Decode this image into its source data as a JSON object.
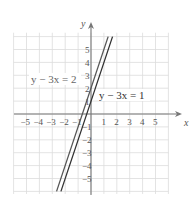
{
  "chart_data": {
    "type": "line",
    "title": "",
    "xlabel": "x",
    "ylabel": "y",
    "xlim": [
      -6,
      6
    ],
    "ylim": [
      -6,
      6
    ],
    "grid": true,
    "x_ticks": [
      "-5",
      "-4",
      "-3",
      "-2",
      "-1",
      "1",
      "2",
      "3",
      "4",
      "5"
    ],
    "y_ticks": [
      "5",
      "4",
      "3",
      "2",
      "1",
      "-1",
      "-2",
      "-3",
      "-4",
      "-5"
    ],
    "series": [
      {
        "name": "y - 3x = 2",
        "equation": "y = 3x + 2",
        "slope": 3,
        "intercept": 2,
        "color": "#555555",
        "x": [
          -2.67,
          1.33
        ],
        "y": [
          -6,
          6
        ]
      },
      {
        "name": "y - 3x = 1",
        "equation": "y = 3x + 1",
        "slope": 3,
        "intercept": 1,
        "color": "#333333",
        "x": [
          -2.33,
          1.67
        ],
        "y": [
          -6,
          6
        ]
      }
    ],
    "annotations": [
      {
        "text": "y − 3x = 2",
        "position": "left of y-axis near y=2.5"
      },
      {
        "text": "y − 3x = 1",
        "position": "right of y-axis near y=1.5"
      }
    ]
  },
  "labels": {
    "x_axis": "x",
    "y_axis": "y",
    "eq_left": "y − 3x = 2",
    "eq_right": "y − 3x = 1"
  }
}
